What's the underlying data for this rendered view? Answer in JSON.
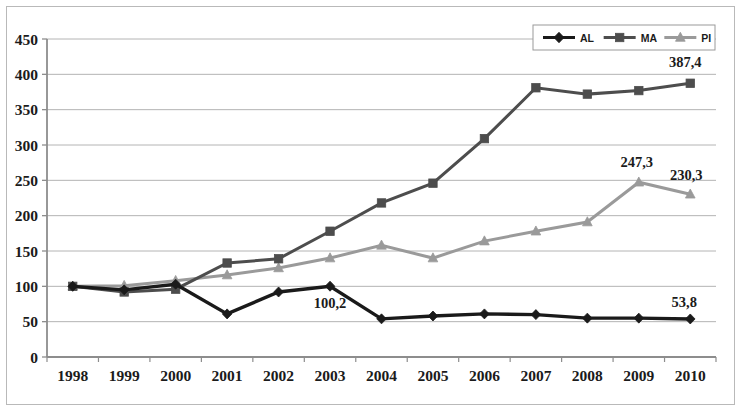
{
  "chart_data": {
    "type": "line",
    "title": "",
    "subtitle": "",
    "xlabel": "",
    "ylabel": "",
    "categories": [
      "1998",
      "1999",
      "2000",
      "2001",
      "2002",
      "2003",
      "2004",
      "2005",
      "2006",
      "2007",
      "2008",
      "2009",
      "2010"
    ],
    "x": [
      1998,
      1999,
      2000,
      2001,
      2002,
      2003,
      2004,
      2005,
      2006,
      2007,
      2008,
      2009,
      2010
    ],
    "series": [
      {
        "name": "AL",
        "color": "#1a1a1a",
        "marker": "diamond",
        "values": [
          100,
          95,
          103,
          61,
          92,
          100.2,
          54,
          58,
          61,
          60,
          55,
          55,
          53.8
        ]
      },
      {
        "name": "MA",
        "color": "#4d4d4d",
        "marker": "square",
        "values": [
          100,
          92,
          96,
          133,
          139,
          178,
          218,
          246,
          309,
          381,
          372,
          377,
          387.4
        ]
      },
      {
        "name": "PI",
        "color": "#9a9a9a",
        "marker": "triangle",
        "values": [
          100,
          101,
          108,
          116,
          126,
          140,
          158,
          140,
          164,
          178,
          191,
          247.3,
          230.3
        ]
      }
    ],
    "ylim": [
      0,
      450
    ],
    "ytick_step": 50,
    "yticks": [
      0,
      50,
      100,
      150,
      200,
      250,
      300,
      350,
      400,
      450
    ],
    "ytick_labels": [
      "0",
      "50",
      "100",
      "150",
      "200",
      "250",
      "300",
      "350",
      "400",
      "450"
    ],
    "grid": true,
    "grid_axis": "y",
    "legend_position": "top-right",
    "legend_entries": [
      "AL",
      "MA",
      "PI"
    ],
    "annotations": [
      {
        "id": "al-2003",
        "text": "100,2",
        "series": "AL",
        "category": "2003",
        "value": 100.2
      },
      {
        "id": "al-2010",
        "text": "53,8",
        "series": "AL",
        "category": "2010",
        "value": 53.8
      },
      {
        "id": "ma-2010",
        "text": "387,4",
        "series": "MA",
        "category": "2010",
        "value": 387.4
      },
      {
        "id": "pi-2009",
        "text": "247,3",
        "series": "PI",
        "category": "2009",
        "value": 247.3
      },
      {
        "id": "pi-2010",
        "text": "230,3",
        "series": "PI",
        "category": "2010",
        "value": 230.3
      }
    ]
  },
  "colors": {
    "al": "#1a1a1a",
    "ma": "#4d4d4d",
    "pi": "#9a9a9a",
    "grid": "#a8a8a8",
    "axis": "#8d8d8d",
    "frame": "#b9b9b9",
    "text": "#1b1b1b",
    "background": "#ffffff"
  }
}
